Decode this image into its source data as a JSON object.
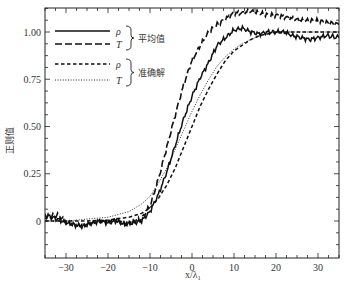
{
  "chart_data": {
    "type": "line",
    "title": "",
    "xlabel": "x/λ₁",
    "ylabel": "正则值",
    "xlim": [
      -35,
      35
    ],
    "ylim": [
      -0.15,
      1.15
    ],
    "xticks": [
      -30,
      -20,
      -10,
      0,
      10,
      20,
      30
    ],
    "xtick_labels": [
      "−30",
      "−20",
      "−10",
      "0",
      "10",
      "20",
      "30"
    ],
    "yticks": [
      0,
      0.25,
      0.5,
      0.75,
      1.0
    ],
    "ytick_labels": [
      "0",
      "0.25",
      "0.50",
      "0.75",
      "1.00"
    ],
    "grid": false,
    "legend_position": "upper left",
    "legend_groups": [
      {
        "label": "平均值",
        "entries": [
          "ρ",
          "T"
        ]
      },
      {
        "label": "准确解",
        "entries": [
          "ρ",
          "T"
        ]
      }
    ],
    "series": [
      {
        "name": "ρ (平均值)",
        "style": "solid",
        "x": [
          -35,
          -32,
          -30,
          -28,
          -26,
          -24,
          -22,
          -20,
          -18,
          -16,
          -14,
          -12,
          -10,
          -8,
          -6,
          -4,
          -2,
          0,
          2,
          4,
          6,
          8,
          10,
          12,
          14,
          16,
          18,
          20,
          22,
          24,
          26,
          28,
          30,
          32,
          35
        ],
        "y": [
          0.03,
          0.01,
          -0.01,
          -0.02,
          -0.03,
          -0.01,
          0.0,
          -0.01,
          0.0,
          -0.02,
          -0.01,
          0.0,
          0.05,
          0.14,
          0.26,
          0.4,
          0.54,
          0.66,
          0.76,
          0.84,
          0.93,
          0.97,
          1.01,
          1.02,
          1.0,
          0.99,
          1.0,
          1.0,
          1.0,
          0.98,
          0.97,
          0.96,
          0.97,
          0.98,
          0.97
        ]
      },
      {
        "name": "T (平均值)",
        "style": "long-dash",
        "x": [
          -35,
          -32,
          -30,
          -28,
          -26,
          -24,
          -22,
          -20,
          -18,
          -16,
          -14,
          -12,
          -10,
          -8,
          -6,
          -4,
          -2,
          0,
          2,
          4,
          6,
          8,
          10,
          12,
          14,
          16,
          18,
          20,
          22,
          24,
          26,
          28,
          30,
          32,
          35
        ],
        "y": [
          0.02,
          0.03,
          0.0,
          -0.02,
          -0.02,
          -0.01,
          0.0,
          0.0,
          0.01,
          -0.01,
          0.0,
          0.01,
          0.08,
          0.22,
          0.39,
          0.56,
          0.72,
          0.85,
          0.93,
          1.0,
          1.04,
          1.07,
          1.1,
          1.1,
          1.11,
          1.1,
          1.09,
          1.09,
          1.08,
          1.07,
          1.06,
          1.06,
          1.06,
          1.05,
          1.04
        ]
      },
      {
        "name": "ρ (准确解)",
        "style": "short-dash",
        "x": [
          -35,
          -30,
          -25,
          -20,
          -15,
          -12,
          -10,
          -8,
          -6,
          -4,
          -2,
          0,
          2,
          4,
          6,
          8,
          10,
          12,
          14,
          16,
          18,
          20,
          25,
          30,
          35
        ],
        "y": [
          0.0,
          0.0,
          0.0,
          0.005,
          0.02,
          0.04,
          0.07,
          0.12,
          0.19,
          0.28,
          0.39,
          0.5,
          0.61,
          0.7,
          0.78,
          0.85,
          0.9,
          0.93,
          0.96,
          0.98,
          0.99,
          1.0,
          1.0,
          1.0,
          1.0
        ]
      },
      {
        "name": "T (准确解)",
        "style": "dotted",
        "x": [
          -35,
          -30,
          -25,
          -20,
          -15,
          -12,
          -10,
          -8,
          -6,
          -4,
          -2,
          0,
          2,
          4,
          6,
          8,
          10,
          12,
          14,
          16,
          18,
          20,
          25,
          30,
          35
        ],
        "y": [
          0.0,
          0.0,
          0.01,
          0.02,
          0.05,
          0.09,
          0.13,
          0.2,
          0.28,
          0.38,
          0.48,
          0.58,
          0.67,
          0.75,
          0.82,
          0.87,
          0.91,
          0.94,
          0.96,
          0.98,
          0.99,
          1.0,
          1.0,
          1.0,
          1.0
        ]
      }
    ]
  }
}
